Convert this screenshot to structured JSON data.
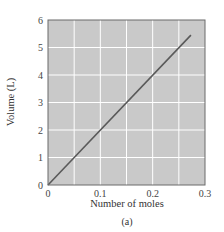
{
  "chart_data": {
    "type": "line",
    "title": "",
    "caption": "(a)",
    "xlabel": "Number of moles",
    "ylabel": "Volume (L)",
    "xlim": [
      0,
      0.3
    ],
    "ylim": [
      0,
      6
    ],
    "xticks": [
      0,
      0.1,
      0.2,
      0.3
    ],
    "xtick_labels": [
      "0",
      "0.1",
      "0.2",
      "0.3"
    ],
    "yticks": [
      0,
      1,
      2,
      3,
      4,
      5,
      6
    ],
    "ytick_labels": [
      "0",
      "1",
      "2",
      "3",
      "4",
      "5",
      "6"
    ],
    "grid": true,
    "x_gridlines": [
      0.05,
      0.1,
      0.15,
      0.2,
      0.25
    ],
    "y_gridlines": [
      1,
      2,
      3,
      4,
      5
    ],
    "legend": null,
    "series": [
      {
        "name": "Volume vs moles",
        "x": [
          0,
          0.273
        ],
        "y": [
          0,
          5.45
        ]
      }
    ],
    "colors": {
      "plot_background": "#c9c9c9",
      "gridline": "#ffffff",
      "line": "#5a5a5a",
      "frame": "#6a6a6a"
    }
  }
}
